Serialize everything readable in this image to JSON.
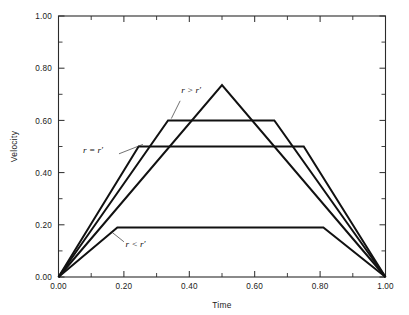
{
  "chart_data": {
    "type": "line",
    "title": "",
    "xlabel": "Time",
    "ylabel": "Velocity",
    "xlim": [
      0.0,
      1.0
    ],
    "ylim": [
      0.0,
      1.0
    ],
    "grid": false,
    "legend_position": "inline-annotations",
    "x_ticks": [
      "0.00",
      "0.20",
      "0.40",
      "0.60",
      "0.80",
      "1.00"
    ],
    "x_tick_values": [
      0.0,
      0.2,
      0.4,
      0.6,
      0.8,
      1.0
    ],
    "x_minor_tick_values": [
      0.1,
      0.3,
      0.5,
      0.7,
      0.9
    ],
    "y_ticks": [
      "0.00",
      "0.20",
      "0.40",
      "0.60",
      "0.80",
      "1.00"
    ],
    "y_tick_values": [
      0.0,
      0.2,
      0.4,
      0.6,
      0.8,
      1.0
    ],
    "y_minor_tick_values": [
      0.1,
      0.3,
      0.5,
      0.7,
      0.9
    ],
    "series": [
      {
        "name": "triangular-profile",
        "x": [
          0.0,
          0.5,
          1.0
        ],
        "values": [
          0.0,
          0.735,
          0.0
        ]
      },
      {
        "name": "plateau-060-profile",
        "x": [
          0.0,
          0.335,
          0.66,
          1.0
        ],
        "values": [
          0.0,
          0.6,
          0.6,
          0.0
        ]
      },
      {
        "name": "plateau-050-profile",
        "x": [
          0.0,
          0.245,
          0.75,
          1.0
        ],
        "values": [
          0.0,
          0.5,
          0.5,
          0.0
        ]
      },
      {
        "name": "plateau-019-profile",
        "x": [
          0.0,
          0.18,
          0.81,
          1.0
        ],
        "values": [
          0.0,
          0.19,
          0.19,
          0.0
        ]
      }
    ],
    "annotations": [
      {
        "id": "r-greater",
        "text": "r > r′",
        "x": 0.375,
        "y": 0.705,
        "leader_from": [
          0.372,
          0.675
        ],
        "leader_to": [
          0.345,
          0.607
        ]
      },
      {
        "id": "r-equal",
        "text": "r = r′",
        "x": 0.075,
        "y": 0.475,
        "leader_from": [
          0.185,
          0.472
        ],
        "leader_to": [
          0.258,
          0.508
        ]
      },
      {
        "id": "r-less",
        "text": "r < r′",
        "x": 0.205,
        "y": 0.115,
        "leader_from": [
          0.2,
          0.135
        ],
        "leader_to": [
          0.16,
          0.175
        ]
      }
    ]
  },
  "colors": {
    "line": "#111111",
    "axis": "#2b2b2b",
    "background": "#ffffff"
  }
}
